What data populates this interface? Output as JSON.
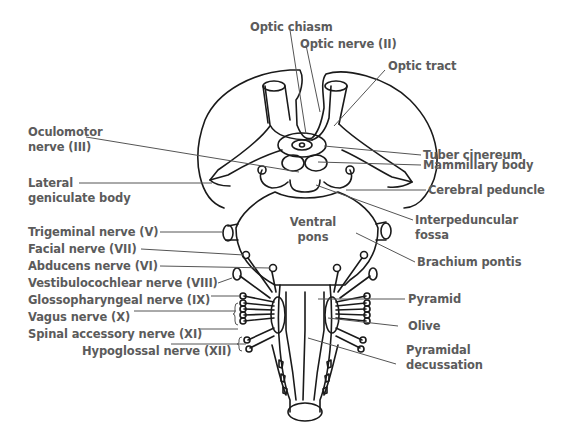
{
  "diagram": {
    "type": "anatomical-diagram",
    "colors": {
      "line": "#1a1a1a",
      "leader": "#555555",
      "text": "#5b5b5b",
      "background": "#ffffff"
    }
  },
  "labels": {
    "optic_chiasm": "Optic chiasm",
    "optic_nerve": "Optic nerve (II)",
    "optic_tract": "Optic tract",
    "oculomotor_line1": "Oculomotor",
    "oculomotor_line2": "nerve (III)",
    "tuber_cinereum": "Tuber cinereum",
    "mammillary_body": "Mammillary body",
    "lateral_geniculate_line1": "Lateral",
    "lateral_geniculate_line2": "geniculate body",
    "cerebral_peduncle": "Cerebral peduncle",
    "trigeminal": "Trigeminal nerve (V)",
    "interpeduncular_line1": "Interpeduncular",
    "interpeduncular_line2": "fossa",
    "ventral_pons_line1": "Ventral",
    "ventral_pons_line2": "pons",
    "facial": "Facial nerve (VII)",
    "abducens": "Abducens nerve (VI)",
    "brachium_pontis": "Brachium pontis",
    "vestibulocochlear": "Vestibulocochlear nerve (VIII)",
    "glossopharyngeal": "Glossopharyngeal nerve (IX)",
    "pyramid": "Pyramid",
    "vagus": "Vagus nerve (X)",
    "olive": "Olive",
    "spinal_accessory": "Spinal accessory nerve (XI)",
    "hypoglossal": "Hypoglossal nerve (XII)",
    "pyramidal_decussation_line1": "Pyramidal",
    "pyramidal_decussation_line2": "decussation"
  }
}
